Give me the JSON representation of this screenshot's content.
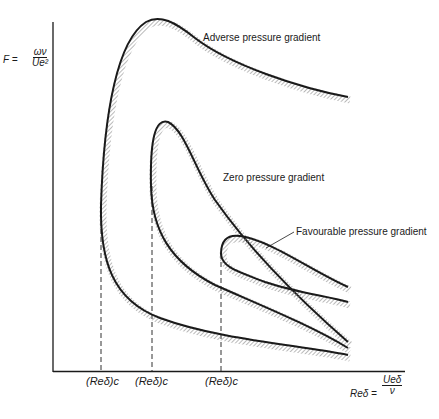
{
  "figure": {
    "y_axis_label": {
      "lhs": "F =",
      "numerator": "ων",
      "denominator": "Ue²"
    },
    "x_axis_label": {
      "lhs": "Reδ =",
      "numerator": "Ueδ",
      "denominator": "ν"
    },
    "critical_labels": [
      "(Reδ)c",
      "(Reδ)c",
      "(Reδ)c"
    ],
    "curves": [
      {
        "name": "Adverse pressure gradient",
        "label": "Adverse pressure gradient"
      },
      {
        "name": "Zero pressure gradient",
        "label": "Zero pressure gradient"
      },
      {
        "name": "Favourable pressure gradient",
        "label": "Favourable pressure gradient"
      }
    ],
    "colors": {
      "line": "#1a1a1a",
      "hatch": "#8a8a8a",
      "background": "#ffffff"
    }
  }
}
